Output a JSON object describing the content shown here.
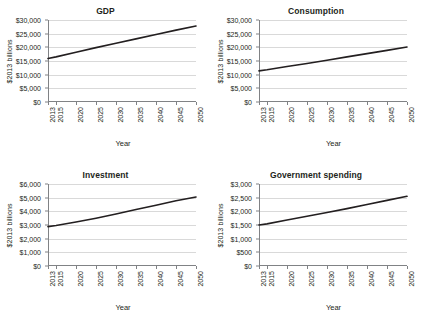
{
  "figure": {
    "background": "#ffffff",
    "line_color": "#231f20",
    "gridline_color": "#d9d9d9",
    "axis_color": "#808285",
    "panel_count": 4
  },
  "chart_data": [
    {
      "type": "line",
      "title": "GDP",
      "xlabel": "Year",
      "ylabel": "$2013 billions",
      "grid": true,
      "legend": "none",
      "xlim": [
        2013,
        2050
      ],
      "ylim": [
        0,
        30000
      ],
      "ytick_labels": [
        "$30,000",
        "$25,000",
        "$20,000",
        "$15,000",
        "$10,000",
        "$5,000",
        "$0"
      ],
      "ytick_values": [
        30000,
        25000,
        20000,
        15000,
        10000,
        5000,
        0
      ],
      "xtick_labels": [
        "2013",
        "2015",
        "2020",
        "2025",
        "2030",
        "2035",
        "2040",
        "2045",
        "2050"
      ],
      "xtick_values": [
        2013,
        2015,
        2020,
        2025,
        2030,
        2035,
        2040,
        2045,
        2050
      ],
      "x": [
        2013,
        2015,
        2020,
        2025,
        2030,
        2035,
        2040,
        2045,
        2050
      ],
      "values": [
        15900,
        16500,
        18200,
        19900,
        21500,
        23100,
        24700,
        26300,
        27800
      ]
    },
    {
      "type": "line",
      "title": "Consumption",
      "xlabel": "Year",
      "ylabel": "$2013 billions",
      "grid": true,
      "legend": "none",
      "xlim": [
        2013,
        2050
      ],
      "ylim": [
        0,
        30000
      ],
      "ytick_labels": [
        "$30,000",
        "$25,000",
        "$20,000",
        "$15,000",
        "$10,000",
        "$5,000",
        "$0"
      ],
      "ytick_values": [
        30000,
        25000,
        20000,
        15000,
        10000,
        5000,
        0
      ],
      "xtick_labels": [
        "2013",
        "2015",
        "2020",
        "2025",
        "2030",
        "2035",
        "2040",
        "2045",
        "2050"
      ],
      "xtick_values": [
        2013,
        2015,
        2020,
        2025,
        2030,
        2035,
        2040,
        2045,
        2050
      ],
      "x": [
        2013,
        2015,
        2020,
        2025,
        2030,
        2035,
        2040,
        2045,
        2050
      ],
      "values": [
        11400,
        11800,
        13000,
        14100,
        15300,
        16500,
        17700,
        18900,
        20100
      ]
    },
    {
      "type": "line",
      "title": "Investment",
      "xlabel": "Year",
      "ylabel": "$2013 billions",
      "grid": true,
      "legend": "none",
      "xlim": [
        2013,
        2050
      ],
      "ylim": [
        0,
        6000
      ],
      "ytick_labels": [
        "$6,000",
        "$5,000",
        "$4,000",
        "$3,000",
        "$2,000",
        "$1,000",
        "$0"
      ],
      "ytick_values": [
        6000,
        5000,
        4000,
        3000,
        2000,
        1000,
        0
      ],
      "xtick_labels": [
        "2013",
        "2015",
        "2020",
        "2025",
        "2030",
        "2035",
        "2040",
        "2045",
        "2050"
      ],
      "xtick_values": [
        2013,
        2015,
        2020,
        2025,
        2030,
        2035,
        2040,
        2045,
        2050
      ],
      "x": [
        2013,
        2015,
        2020,
        2025,
        2030,
        2035,
        2040,
        2045,
        2050
      ],
      "values": [
        2880,
        2960,
        3220,
        3500,
        3800,
        4130,
        4450,
        4770,
        5050
      ]
    },
    {
      "type": "line",
      "title": "Government spending",
      "xlabel": "Year",
      "ylabel": "$2013 billions",
      "grid": true,
      "legend": "none",
      "xlim": [
        2013,
        2050
      ],
      "ylim": [
        0,
        3000
      ],
      "ytick_labels": [
        "$3,000",
        "$2,500",
        "$2,000",
        "$1,500",
        "$1,000",
        "$500",
        "$0"
      ],
      "ytick_values": [
        3000,
        2500,
        2000,
        1500,
        1000,
        500,
        0
      ],
      "xtick_labels": [
        "2013",
        "2015",
        "2020",
        "2025",
        "2030",
        "2035",
        "2040",
        "2045",
        "2050"
      ],
      "xtick_values": [
        2013,
        2015,
        2020,
        2025,
        2030,
        2035,
        2040,
        2045,
        2050
      ],
      "x": [
        2013,
        2015,
        2020,
        2025,
        2030,
        2035,
        2040,
        2045,
        2050
      ],
      "values": [
        1500,
        1540,
        1680,
        1820,
        1960,
        2100,
        2250,
        2400,
        2550
      ]
    }
  ]
}
